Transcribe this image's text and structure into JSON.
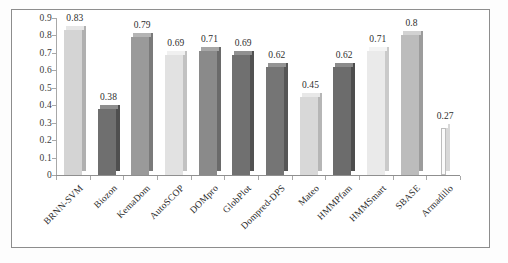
{
  "chart_data": {
    "type": "bar",
    "title": "",
    "subtitle": "",
    "xlabel": "",
    "ylabel": "",
    "ylim": [
      0,
      0.9
    ],
    "grid": false,
    "legend": "none",
    "y_ticks": [
      "0",
      "0.1",
      "0.2",
      "0.3",
      "0.4",
      "0.5",
      "0.6",
      "0.7",
      "0.8",
      "0.9"
    ],
    "y_tick_values": [
      0,
      0.1,
      0.2,
      0.3,
      0.4,
      0.5,
      0.6,
      0.7,
      0.8,
      0.9
    ],
    "categories": [
      "BRNN-SVM",
      "Biozon",
      "KemaDom",
      "AutoSCOP",
      "DOMpro",
      "GlobPlot",
      "Dompred-DPS",
      "Mateo",
      "HMMPfam",
      "HMMSmart",
      "SBASE",
      "Armadillo"
    ],
    "values": [
      0.83,
      0.38,
      0.79,
      0.69,
      0.71,
      0.69,
      0.62,
      0.45,
      0.62,
      0.71,
      0.8,
      0.27
    ],
    "value_labels": [
      "0.83",
      "0.38",
      "0.79",
      "0.69",
      "0.71",
      "0.69",
      "0.62",
      "0.45",
      "0.62",
      "0.71",
      "0.8",
      "0.27"
    ],
    "bar_colors": [
      "#d4d4d4",
      "#6f6f6f",
      "#9a9a9a",
      "#e2e2e2",
      "#8a8a8a",
      "#707070",
      "#757575",
      "#d8d8d8",
      "#6c6c6c",
      "#eaeaea",
      "#bcbcbc",
      "#fbfbfb"
    ],
    "bar_top_colors": [
      "#e6e6e6",
      "#8e8e8e",
      "#b4b4b4",
      "#f0f0f0",
      "#a6a6a6",
      "#909090",
      "#949494",
      "#e8e8e8",
      "#8b8b8b",
      "#f4f4f4",
      "#d2d2d2",
      "#ffffff"
    ],
    "bar_side_colors": [
      "#b0b0b0",
      "#4f4f4f",
      "#7a7a7a",
      "#c2c2c2",
      "#6a6a6a",
      "#525252",
      "#565656",
      "#b6b6b6",
      "#4d4d4d",
      "#cacaca",
      "#9c9c9c",
      "#d8d8d8"
    ],
    "bar_widths": [
      18,
      18,
      18,
      18,
      18,
      18,
      18,
      18,
      18,
      18,
      18,
      5
    ],
    "axis_color": "#8f8f8f",
    "frame_color": "#8d8d8d",
    "text_color": "#2b2b2b"
  }
}
